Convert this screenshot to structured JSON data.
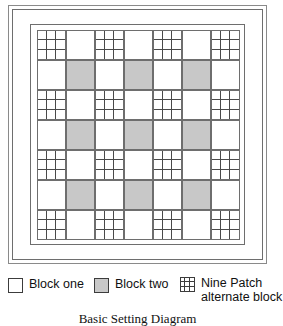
{
  "diagram": {
    "caption": "Basic Setting Diagram",
    "colors": {
      "block_one": "#ffffff",
      "block_two": "#c8c8c8",
      "line": "#6e6e6e",
      "patch_line": "#4a4a4a"
    },
    "grid": {
      "rows": 7,
      "columns": 7,
      "cells": [
        [
          "ninepatch",
          "plain",
          "ninepatch",
          "plain",
          "ninepatch",
          "plain",
          "ninepatch"
        ],
        [
          "plain",
          "shaded",
          "plain",
          "shaded",
          "plain",
          "shaded",
          "plain"
        ],
        [
          "ninepatch",
          "plain",
          "ninepatch",
          "plain",
          "ninepatch",
          "plain",
          "ninepatch"
        ],
        [
          "plain",
          "shaded",
          "plain",
          "shaded",
          "plain",
          "shaded",
          "plain"
        ],
        [
          "ninepatch",
          "plain",
          "ninepatch",
          "plain",
          "ninepatch",
          "plain",
          "ninepatch"
        ],
        [
          "plain",
          "shaded",
          "plain",
          "shaded",
          "plain",
          "shaded",
          "plain"
        ],
        [
          "ninepatch",
          "plain",
          "ninepatch",
          "plain",
          "ninepatch",
          "plain",
          "ninepatch"
        ]
      ]
    }
  },
  "legend": {
    "items": [
      {
        "label": "Block one",
        "label_line2": "",
        "swatch": "white-square"
      },
      {
        "label": "Block two",
        "label_line2": "",
        "swatch": "gray-square"
      },
      {
        "label": "Nine Patch",
        "label_line2": "alternate block",
        "swatch": "nine-patch-square"
      }
    ]
  }
}
